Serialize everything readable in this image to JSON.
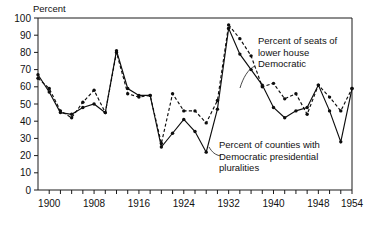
{
  "chart_data": {
    "type": "line",
    "title": "",
    "ylabel": "Percent",
    "xlabel": "",
    "ylim": [
      0,
      100
    ],
    "xlim": [
      1898,
      1954
    ],
    "grid": false,
    "legend_position": "inline-annotations",
    "y_ticks": [
      0,
      10,
      20,
      30,
      40,
      50,
      60,
      70,
      80,
      90,
      100
    ],
    "y_tick_labels": [
      "0",
      "10",
      "20",
      "30",
      "40",
      "50",
      "60",
      "70",
      "80",
      "90",
      "100"
    ],
    "x_ticks": [
      1900,
      1902,
      1904,
      1906,
      1908,
      1910,
      1912,
      1914,
      1916,
      1918,
      1920,
      1922,
      1924,
      1926,
      1928,
      1930,
      1932,
      1934,
      1936,
      1938,
      1940,
      1942,
      1944,
      1946,
      1948,
      1950,
      1952,
      1954
    ],
    "x_tick_labels": [
      "1900",
      "1908",
      "1916",
      "1924",
      "1932",
      "1940",
      "1948",
      "1954"
    ],
    "x_labeled_ticks": [
      1900,
      1908,
      1916,
      1924,
      1932,
      1940,
      1948,
      1954
    ],
    "series": [
      {
        "name": "Percent of seats of lower house Democratic",
        "style": "dashed",
        "x": [
          1898,
          1900,
          1902,
          1904,
          1906,
          1908,
          1910,
          1912,
          1914,
          1916,
          1918,
          1920,
          1922,
          1924,
          1926,
          1928,
          1930,
          1932,
          1934,
          1936,
          1938,
          1940,
          1942,
          1944,
          1946,
          1948,
          1950,
          1952,
          1954
        ],
        "values": [
          65,
          59,
          46,
          42,
          51,
          58,
          45,
          80,
          56,
          54,
          55,
          27,
          56,
          46,
          46,
          39,
          52,
          96,
          88,
          78,
          60,
          62,
          53,
          56,
          44,
          61,
          54,
          46,
          59
        ]
      },
      {
        "name": "Percent of counties with Democratic presidential pluralities",
        "style": "solid",
        "x": [
          1898,
          1900,
          1902,
          1904,
          1906,
          1908,
          1910,
          1912,
          1914,
          1916,
          1918,
          1920,
          1922,
          1924,
          1926,
          1928,
          1930,
          1932,
          1934,
          1936,
          1938,
          1940,
          1942,
          1944,
          1946,
          1948,
          1950,
          1952,
          1954
        ],
        "values": [
          67,
          57,
          45,
          44,
          48,
          50,
          45,
          81,
          59,
          55,
          55,
          25,
          33,
          41,
          34,
          22,
          47,
          94,
          79,
          70,
          61,
          48,
          42,
          46,
          48,
          61,
          46,
          28,
          59
        ]
      }
    ],
    "annotations": [
      {
        "name": "lower-house-annotation",
        "lines": [
          "Percent of seats of",
          "lower house",
          "Democratic"
        ],
        "x": 258,
        "y": 44
      },
      {
        "name": "counties-annotation",
        "lines": [
          "Percent of counties with",
          "Democratic presidential",
          "pluralities"
        ],
        "x": 219,
        "y": 148
      }
    ]
  },
  "axis": {
    "y_title": "Percent"
  }
}
